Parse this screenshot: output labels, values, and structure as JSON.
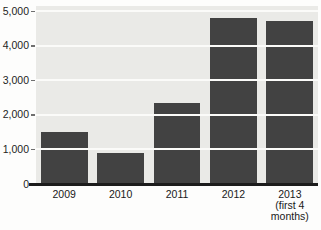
{
  "chart_data": {
    "type": "bar",
    "title": "",
    "xlabel": "",
    "ylabel": "",
    "categories": [
      "2009",
      "2010",
      "2011",
      "2012",
      "2013 (first 4 months)"
    ],
    "category_lines": [
      [
        "2009"
      ],
      [
        "2010"
      ],
      [
        "2011"
      ],
      [
        "2012"
      ],
      [
        "2013",
        "(first 4",
        "months)"
      ]
    ],
    "values": [
      1500,
      900,
      2350,
      4800,
      4700
    ],
    "ylim": [
      0,
      5000
    ],
    "ytick_interval": 1000,
    "yticks": [
      "0",
      "1,000",
      "2,000",
      "3,000",
      "4,000",
      "5,000"
    ],
    "grid": "horizontal",
    "legend": "none",
    "colors": {
      "bar": "#424242",
      "plot_background": "#eaeae7",
      "gridline": "#fbfbf9",
      "axis_line": "#1c1c1c",
      "label_text": "#1d1d1d",
      "page_background": "#fdfdfc"
    }
  }
}
